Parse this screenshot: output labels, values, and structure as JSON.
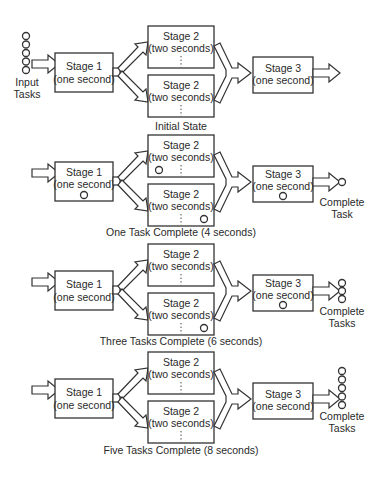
{
  "diagram": {
    "labels": {
      "stage1_title": "Stage 1",
      "stage1_time": "(one second)",
      "stage2_title": "Stage 2",
      "stage2_time": "(two seconds)",
      "stage3_title": "Stage 3",
      "stage3_time": "(one second)",
      "input_line1": "Input",
      "input_line2": "Tasks",
      "complete_line1": "Complete",
      "complete_task": "Task",
      "complete_tasks": "Tasks"
    },
    "panels": [
      {
        "caption": "Initial State",
        "input_tasks": 5,
        "stage1_tasks": 0,
        "stage2_top_tasks": 0,
        "stage2_bottom_tasks": 0,
        "stage3_tasks": 0,
        "complete_tasks": 0
      },
      {
        "caption": "One Task Complete (4 seconds)",
        "input_tasks": 0,
        "stage1_tasks": 1,
        "stage2_top_tasks": 1,
        "stage2_bottom_tasks": 1,
        "stage3_tasks": 1,
        "complete_tasks": 1
      },
      {
        "caption": "Three Tasks Complete (6 seconds)",
        "input_tasks": 0,
        "stage1_tasks": 0,
        "stage2_top_tasks": 0,
        "stage2_bottom_tasks": 1,
        "stage3_tasks": 1,
        "complete_tasks": 3
      },
      {
        "caption": "Five Tasks Complete (8 seconds)",
        "input_tasks": 0,
        "stage1_tasks": 0,
        "stage2_top_tasks": 0,
        "stage2_bottom_tasks": 0,
        "stage3_tasks": 0,
        "complete_tasks": 5
      }
    ]
  }
}
